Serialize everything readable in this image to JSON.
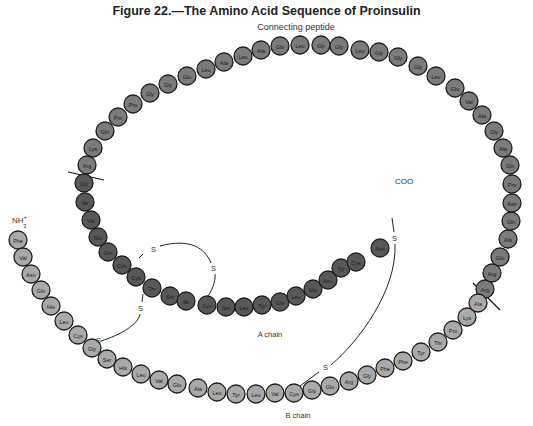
{
  "figure": {
    "title": "Figure 22.—The Amino Acid Sequence of Proinsulin"
  },
  "labels": {
    "connecting_peptide": "Connecting peptide",
    "a_chain": "A chain",
    "b_chain": "B chain",
    "n_terminus": "NH",
    "n_terminus_sup": "+",
    "n_terminus_sub": "3",
    "c_terminus": "COO",
    "sulfur": "S"
  },
  "colors": {
    "b_chain": "#a9a9a9",
    "connecting_peptide": "#7b7b7b",
    "a_chain": "#585858",
    "stroke": "#1e1e1e"
  },
  "b_chain": [
    {
      "aa": "Phe",
      "x": 18,
      "y": 240
    },
    {
      "aa": "Val",
      "x": 23,
      "y": 257
    },
    {
      "aa": "Asn",
      "x": 31,
      "y": 274
    },
    {
      "aa": "Gln",
      "x": 41,
      "y": 290
    },
    {
      "aa": "His",
      "x": 51,
      "y": 306
    },
    {
      "aa": "Leu",
      "x": 64,
      "y": 321
    },
    {
      "aa": "Cys",
      "x": 78,
      "y": 335
    },
    {
      "aa": "Gly",
      "x": 92,
      "y": 348
    },
    {
      "aa": "Ser",
      "x": 107,
      "y": 359
    },
    {
      "aa": "His",
      "x": 123,
      "y": 367
    },
    {
      "aa": "Leu",
      "x": 141,
      "y": 374
    },
    {
      "aa": "Val",
      "x": 159,
      "y": 380
    },
    {
      "aa": "Glu",
      "x": 177,
      "y": 384
    },
    {
      "aa": "Ala",
      "x": 198,
      "y": 388
    },
    {
      "aa": "Leu",
      "x": 217,
      "y": 392
    },
    {
      "aa": "Tyr",
      "x": 236,
      "y": 394
    },
    {
      "aa": "Leu",
      "x": 256,
      "y": 394
    },
    {
      "aa": "Val",
      "x": 275,
      "y": 393
    },
    {
      "aa": "Cys",
      "x": 294,
      "y": 393
    },
    {
      "aa": "Gly",
      "x": 312,
      "y": 390
    },
    {
      "aa": "Glu",
      "x": 330,
      "y": 386
    },
    {
      "aa": "Arg",
      "x": 349,
      "y": 381
    },
    {
      "aa": "Gly",
      "x": 367,
      "y": 375
    },
    {
      "aa": "Phe",
      "x": 385,
      "y": 368
    },
    {
      "aa": "Phe",
      "x": 403,
      "y": 361
    },
    {
      "aa": "Tyr",
      "x": 421,
      "y": 352
    },
    {
      "aa": "Thr",
      "x": 438,
      "y": 342
    },
    {
      "aa": "Pro",
      "x": 453,
      "y": 330
    },
    {
      "aa": "Lys",
      "x": 467,
      "y": 317
    },
    {
      "aa": "Ala",
      "x": 478,
      "y": 303
    }
  ],
  "connecting_peptide": [
    {
      "aa": "Arg",
      "x": 485,
      "y": 289
    },
    {
      "aa": "Arg",
      "x": 492,
      "y": 273
    },
    {
      "aa": "Glu",
      "x": 500,
      "y": 257
    },
    {
      "aa": "Ala",
      "x": 508,
      "y": 239
    },
    {
      "aa": "Gln",
      "x": 511,
      "y": 221
    },
    {
      "aa": "Asn",
      "x": 512,
      "y": 203
    },
    {
      "aa": "Pro",
      "x": 512,
      "y": 184
    },
    {
      "aa": "Gln",
      "x": 510,
      "y": 165
    },
    {
      "aa": "Ala",
      "x": 503,
      "y": 148
    },
    {
      "aa": "Gly",
      "x": 494,
      "y": 131
    },
    {
      "aa": "Ala",
      "x": 482,
      "y": 115
    },
    {
      "aa": "Val",
      "x": 469,
      "y": 101
    },
    {
      "aa": "Glu",
      "x": 455,
      "y": 88
    },
    {
      "aa": "Leu",
      "x": 436,
      "y": 76
    },
    {
      "aa": "Gly",
      "x": 418,
      "y": 66
    },
    {
      "aa": "Gly",
      "x": 398,
      "y": 57
    },
    {
      "aa": "Gly",
      "x": 379,
      "y": 52
    },
    {
      "aa": "Leu",
      "x": 360,
      "y": 50
    },
    {
      "aa": "Gly",
      "x": 339,
      "y": 46
    },
    {
      "aa": "Gly",
      "x": 321,
      "y": 45
    },
    {
      "aa": "Leu",
      "x": 300,
      "y": 45
    },
    {
      "aa": "Gln",
      "x": 280,
      "y": 46
    },
    {
      "aa": "Ala",
      "x": 261,
      "y": 50
    },
    {
      "aa": "Leu",
      "x": 243,
      "y": 56
    },
    {
      "aa": "Ala",
      "x": 224,
      "y": 62
    },
    {
      "aa": "Leu",
      "x": 206,
      "y": 69
    },
    {
      "aa": "Glu",
      "x": 187,
      "y": 76
    },
    {
      "aa": "Gly",
      "x": 168,
      "y": 84
    },
    {
      "aa": "Gly",
      "x": 150,
      "y": 93
    },
    {
      "aa": "Pro",
      "x": 133,
      "y": 104
    },
    {
      "aa": "Pro",
      "x": 118,
      "y": 117
    },
    {
      "aa": "Gln",
      "x": 105,
      "y": 131
    },
    {
      "aa": "Lys",
      "x": 93,
      "y": 148
    },
    {
      "aa": "Arg",
      "x": 87,
      "y": 165
    }
  ],
  "a_chain": [
    {
      "aa": "Gly",
      "x": 84,
      "y": 183
    },
    {
      "aa": "Ile",
      "x": 85,
      "y": 202
    },
    {
      "aa": "Val",
      "x": 91,
      "y": 220
    },
    {
      "aa": "Glu",
      "x": 98,
      "y": 237
    },
    {
      "aa": "Gln",
      "x": 108,
      "y": 252
    },
    {
      "aa": "Cys",
      "x": 122,
      "y": 265
    },
    {
      "aa": "Cys",
      "x": 136,
      "y": 277
    },
    {
      "aa": "Thr",
      "x": 152,
      "y": 288
    },
    {
      "aa": "Ser",
      "x": 170,
      "y": 296
    },
    {
      "aa": "Ile",
      "x": 186,
      "y": 301
    },
    {
      "aa": "Cys",
      "x": 207,
      "y": 305
    },
    {
      "aa": "Ser",
      "x": 226,
      "y": 307
    },
    {
      "aa": "Leu",
      "x": 244,
      "y": 307
    },
    {
      "aa": "Tyr",
      "x": 262,
      "y": 305
    },
    {
      "aa": "Gln",
      "x": 280,
      "y": 302
    },
    {
      "aa": "Leu",
      "x": 296,
      "y": 296
    },
    {
      "aa": "Glu",
      "x": 313,
      "y": 289
    },
    {
      "aa": "Asn",
      "x": 328,
      "y": 280
    },
    {
      "aa": "Tyr",
      "x": 341,
      "y": 268
    },
    {
      "aa": "Cys",
      "x": 356,
      "y": 262
    },
    {
      "aa": "Asn",
      "x": 380,
      "y": 248
    }
  ]
}
